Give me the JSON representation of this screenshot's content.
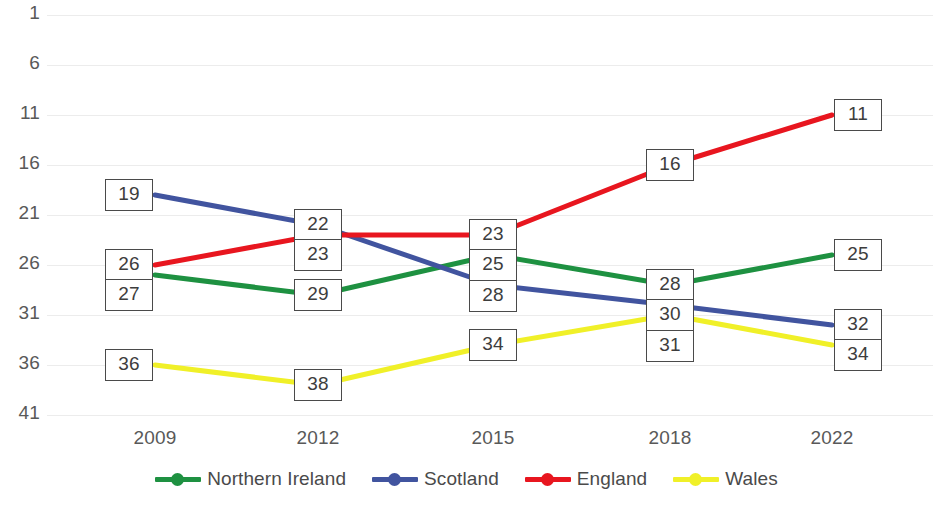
{
  "chart_data": {
    "type": "line",
    "title": "",
    "subtitle": "",
    "xlabel": "",
    "ylabel": "",
    "categories": [
      "2009",
      "2012",
      "2015",
      "2018",
      "2022"
    ],
    "x_tick_labels": [
      "2009",
      "2012",
      "2015",
      "2018",
      "2022"
    ],
    "y_tick_labels": [
      "1",
      "6",
      "11",
      "16",
      "21",
      "26",
      "31",
      "36",
      "41"
    ],
    "y_tick_values": [
      1,
      6,
      11,
      16,
      21,
      26,
      31,
      36,
      41
    ],
    "ylim": [
      1,
      41
    ],
    "y_inverted": true,
    "grid": true,
    "legend_position": "bottom",
    "data_labels_shown": true,
    "series": [
      {
        "name": "Northern Ireland",
        "color": "#1E9141",
        "values": [
          27,
          29,
          25,
          28,
          25
        ],
        "labels": [
          "27",
          "29",
          "25",
          "28",
          "25"
        ]
      },
      {
        "name": "Scotland",
        "color": "#41549F",
        "values": [
          19,
          22,
          28,
          30,
          32
        ],
        "labels": [
          "19",
          "22",
          "28",
          "30",
          "32"
        ]
      },
      {
        "name": "England",
        "color": "#E8161F",
        "values": [
          26,
          23,
          23,
          16,
          11
        ],
        "labels": [
          "26",
          "23",
          "23",
          "16",
          "11"
        ]
      },
      {
        "name": "Wales",
        "color": "#F0F028",
        "values": [
          36,
          38,
          34,
          31,
          34
        ],
        "labels": [
          "36",
          "38",
          "34",
          "31",
          "34"
        ]
      }
    ]
  },
  "axis": {
    "y_ticks": [
      {
        "label": "1",
        "value": 1
      },
      {
        "label": "6",
        "value": 6
      },
      {
        "label": "11",
        "value": 11
      },
      {
        "label": "16",
        "value": 16
      },
      {
        "label": "21",
        "value": 21
      },
      {
        "label": "26",
        "value": 26
      },
      {
        "label": "31",
        "value": 31
      },
      {
        "label": "36",
        "value": 36
      },
      {
        "label": "41",
        "value": 41
      }
    ],
    "x_ticks": [
      {
        "label": "2009"
      },
      {
        "label": "2012"
      },
      {
        "label": "2015"
      },
      {
        "label": "2018"
      },
      {
        "label": "2022"
      }
    ]
  },
  "legend": {
    "items": [
      {
        "label": "Northern Ireland",
        "color": "#1E9141"
      },
      {
        "label": "Scotland",
        "color": "#41549F"
      },
      {
        "label": "England",
        "color": "#E8161F"
      },
      {
        "label": "Wales",
        "color": "#F0F028"
      }
    ]
  },
  "colors": {
    "gridline": "#ececec",
    "tick_text": "#595959",
    "label_box_border": "#4a4a4a",
    "label_box_background": "#ffffff",
    "background": "#ffffff"
  }
}
